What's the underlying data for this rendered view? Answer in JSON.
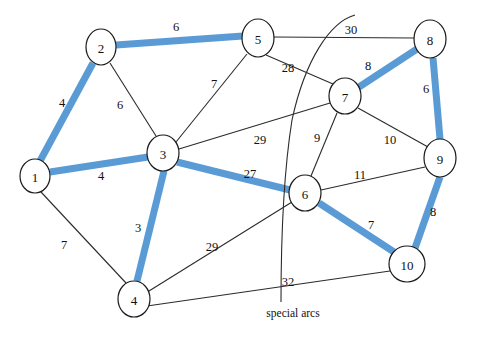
{
  "figure": {
    "type": "graph-diagram",
    "background_color": "#ffffff",
    "width": 477,
    "height": 340
  },
  "style": {
    "highlight_color": "#5b9bd5",
    "line_color": "#2b2b2b",
    "node_fill": "#ffffff",
    "node_stroke": "#1a1a1a"
  },
  "nodes": [
    {
      "id": "1",
      "label": "1",
      "x": 35,
      "y": 176,
      "rx": 15,
      "ry": 17
    },
    {
      "id": "2",
      "label": "2",
      "x": 101,
      "y": 47,
      "rx": 15,
      "ry": 18
    },
    {
      "id": "3",
      "label": "3",
      "x": 163,
      "y": 153,
      "rx": 16,
      "ry": 18
    },
    {
      "id": "4",
      "label": "4",
      "x": 134,
      "y": 299,
      "rx": 16,
      "ry": 18
    },
    {
      "id": "5",
      "label": "5",
      "x": 258,
      "y": 38,
      "rx": 16,
      "ry": 19
    },
    {
      "id": "6",
      "label": "6",
      "x": 305,
      "y": 193,
      "rx": 16,
      "ry": 18
    },
    {
      "id": "7",
      "label": "7",
      "x": 345,
      "y": 96,
      "rx": 16,
      "ry": 18
    },
    {
      "id": "8",
      "label": "8",
      "x": 430,
      "y": 39,
      "rx": 16,
      "ry": 19
    },
    {
      "id": "9",
      "label": "9",
      "x": 440,
      "y": 158,
      "rx": 16,
      "ry": 19
    },
    {
      "id": "10",
      "label": "10",
      "x": 407,
      "y": 264,
      "rx": 18,
      "ry": 18
    }
  ],
  "edges": [
    {
      "from": "2",
      "to": "5",
      "weight": "6",
      "highlighted": true,
      "label_x": 176,
      "label_y": 27
    },
    {
      "from": "1",
      "to": "2",
      "weight": "4",
      "highlighted": true,
      "label_x": 62,
      "label_y": 103
    },
    {
      "from": "2",
      "to": "3",
      "weight": "6",
      "highlighted": false,
      "label_x": 120,
      "label_y": 105
    },
    {
      "from": "1",
      "to": "3",
      "weight": "4",
      "highlighted": true,
      "label_x": 101,
      "label_y": 176
    },
    {
      "from": "1",
      "to": "4",
      "weight": "7",
      "highlighted": false,
      "label_x": 64,
      "label_y": 245
    },
    {
      "from": "3",
      "to": "4",
      "weight": "3",
      "highlighted": true,
      "label_x": 138,
      "label_y": 228
    },
    {
      "from": "3",
      "to": "5",
      "weight": "7",
      "highlighted": false,
      "label_x": 214,
      "label_y": 84
    },
    {
      "from": "3",
      "to": "7",
      "weight": "29",
      "highlighted": false,
      "label_x": 260,
      "label_y": 140
    },
    {
      "from": "3",
      "to": "6",
      "weight": "27",
      "highlighted": true,
      "label_x": 250,
      "label_y": 174
    },
    {
      "from": "5",
      "to": "8",
      "weight": "30",
      "highlighted": false,
      "label_x": 351,
      "label_y": 30
    },
    {
      "from": "5",
      "to": "7",
      "weight": "28",
      "highlighted": false,
      "label_x": 288,
      "label_y": 68
    },
    {
      "from": "7",
      "to": "8",
      "weight": "8",
      "highlighted": true,
      "label_x": 368,
      "label_y": 66
    },
    {
      "from": "8",
      "to": "9",
      "weight": "6",
      "highlighted": true,
      "label_x": 426,
      "label_y": 89
    },
    {
      "from": "7",
      "to": "6",
      "weight": "9",
      "highlighted": false,
      "label_x": 317,
      "label_y": 138
    },
    {
      "from": "7",
      "to": "9",
      "weight": "10",
      "highlighted": false,
      "label_x": 390,
      "label_y": 140
    },
    {
      "from": "6",
      "to": "9",
      "weight": "11",
      "highlighted": false,
      "label_x": 360,
      "label_y": 175
    },
    {
      "from": "6",
      "to": "10",
      "weight": "7",
      "highlighted": true,
      "label_x": 371,
      "label_y": 225
    },
    {
      "from": "9",
      "to": "10",
      "weight": "8",
      "highlighted": true,
      "label_x": 433,
      "label_y": 212
    },
    {
      "from": "4",
      "to": "6",
      "weight": "29",
      "highlighted": false,
      "label_x": 212,
      "label_y": 247
    },
    {
      "from": "4",
      "to": "10",
      "weight": "32",
      "highlighted": false,
      "label_x": 288,
      "label_y": 282
    }
  ],
  "annotations": [
    {
      "id": "special-arcs",
      "text": "special arcs",
      "x": 293,
      "y": 313
    }
  ],
  "special_arc": {
    "description": "curved pointer line from top right down to the special arcs caption"
  }
}
